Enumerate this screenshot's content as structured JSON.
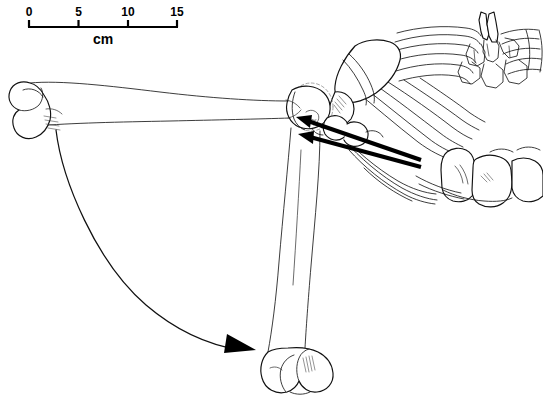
{
  "figure": {
    "background_color": "#ffffff",
    "ink_color": "#000000",
    "width": 543,
    "height": 414
  },
  "scale_bar": {
    "name": "scale-bar",
    "unit_label": "cm",
    "tick_labels": [
      "0",
      "5",
      "10",
      "15"
    ],
    "tick_values": [
      0,
      5,
      10,
      15
    ],
    "pixels_per_unit": 10,
    "bar_start_x": 28,
    "bar_end_x": 178,
    "bar_y": 26
  },
  "anatomy": {
    "humerus_extended": {
      "name": "humerus-extended",
      "description": "Humerus drawn in protracted, near-horizontal position"
    },
    "humerus_flexed": {
      "name": "humerus-flexed",
      "description": "Humerus drawn in retracted, near-vertical hanging position"
    },
    "scapula": {
      "name": "scapula",
      "description": "Scapular blade with spine, articulating at glenoid"
    },
    "ribcage": {
      "name": "ribcage",
      "description": "Thoracic ribs radiating from vertebral column"
    },
    "thoracic_vertebrae": {
      "name": "thoracic-vertebrae",
      "description": "Thoracic vertebrae with dorsal spinous processes"
    },
    "cervical_vertebrae": {
      "name": "cervical-vertebrae",
      "description": "Cervical vertebrae in ventral view"
    },
    "glenohumeral_joint": {
      "name": "glenohumeral-joint",
      "description": "Shoulder joint centre of rotation"
    },
    "distal_condyles_extended": {
      "name": "distal-condyles-extended",
      "description": "Distal humeral condyles at left end of extended humerus"
    },
    "distal_condyles_flexed": {
      "name": "distal-condyles-flexed",
      "description": "Distal humeral condyles at lower end of flexed humerus"
    },
    "humeral_head_ghost": {
      "name": "humeral-head-ghost",
      "description": "Dashed outline of humeral head articular surface"
    }
  },
  "annotations": {
    "force_arrows": [
      {
        "name": "force-arrow-upper",
        "from_x": 421,
        "from_y": 160,
        "to_x": 299,
        "to_y": 118,
        "style": "solid-thick"
      },
      {
        "name": "force-arrow-lower",
        "from_x": 421,
        "from_y": 166,
        "to_x": 301,
        "to_y": 134,
        "style": "solid-thick"
      }
    ],
    "motion_arrow": {
      "name": "excursion-arrow",
      "from_x": 56,
      "from_y": 130,
      "to_x": 255,
      "to_y": 350,
      "style": "curved-sweep",
      "description": "Curved arrow showing humeral excursion from extended to flexed position"
    }
  }
}
